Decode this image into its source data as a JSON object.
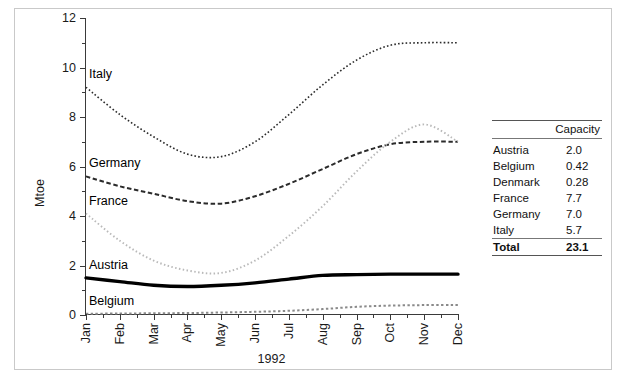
{
  "chart_data": {
    "type": "line",
    "title": "",
    "xlabel": "1992",
    "ylabel": "Mtoe",
    "ylim": [
      0,
      12
    ],
    "yticks": [
      0,
      2,
      4,
      6,
      8,
      10,
      12
    ],
    "yminor_step": 1,
    "grid": false,
    "legend": "in-plot labels at left of each series",
    "categories": [
      "Jan",
      "Feb",
      "Mar",
      "Apr",
      "May",
      "Jun",
      "Jul",
      "Aug",
      "Sep",
      "Oct",
      "Nov",
      "Dec"
    ],
    "series": [
      {
        "name": "Italy",
        "style": "fine-dotted",
        "label_x": "Jan",
        "values": [
          9.2,
          8.1,
          7.2,
          6.5,
          6.4,
          7.0,
          8.1,
          9.3,
          10.3,
          10.9,
          11.0,
          11.0
        ]
      },
      {
        "name": "Germany",
        "style": "dashed",
        "label_x": "Jan",
        "values": [
          5.6,
          5.2,
          4.9,
          4.6,
          4.5,
          4.8,
          5.3,
          5.9,
          6.5,
          6.9,
          7.0,
          7.0
        ]
      },
      {
        "name": "France",
        "style": "light-dotted",
        "label_x": "Jan",
        "values": [
          4.1,
          3.0,
          2.2,
          1.8,
          1.7,
          2.2,
          3.2,
          4.4,
          5.8,
          7.0,
          7.7,
          7.0
        ]
      },
      {
        "name": "Austria",
        "style": "thick-solid",
        "label_x": "Jan",
        "values": [
          1.5,
          1.35,
          1.2,
          1.15,
          1.2,
          1.3,
          1.45,
          1.6,
          1.63,
          1.65,
          1.65,
          1.65
        ]
      },
      {
        "name": "Belgium",
        "style": "square-dotted",
        "label_x": "Jan",
        "values": [
          0.05,
          0.06,
          0.07,
          0.08,
          0.1,
          0.13,
          0.17,
          0.24,
          0.33,
          0.38,
          0.4,
          0.4
        ]
      }
    ]
  },
  "axis": {
    "y_title": "Mtoe",
    "x_title": "1992",
    "y_tick_labels": [
      "0",
      "2",
      "4",
      "6",
      "8",
      "10",
      "12"
    ],
    "x_tick_labels": [
      "Jan",
      "Feb",
      "Mar",
      "Apr",
      "May",
      "Jun",
      "Jul",
      "Aug",
      "Sep",
      "Oct",
      "Nov",
      "Dec"
    ]
  },
  "series_labels": {
    "italy": "Italy",
    "germany": "Germany",
    "france": "France",
    "austria": "Austria",
    "belgium": "Belgium"
  },
  "capacity_table": {
    "header_col1": "",
    "header_col2": "Capacity",
    "rows": [
      {
        "country": "Austria",
        "capacity": "2.0"
      },
      {
        "country": "Belgium",
        "capacity": "0.42"
      },
      {
        "country": "Denmark",
        "capacity": "0.28"
      },
      {
        "country": "France",
        "capacity": "7.7"
      },
      {
        "country": "Germany",
        "capacity": "7.0"
      },
      {
        "country": "Italy",
        "capacity": "5.7"
      }
    ],
    "total_label": "Total",
    "total_value": "23.1"
  },
  "colors": {
    "axis": "#3a3a3a",
    "italy": "#2b2b2b",
    "germany": "#2b2b2b",
    "france": "#b9b9b9",
    "austria": "#000000",
    "belgium": "#8a8a8a",
    "border": "#c9c9c9"
  }
}
